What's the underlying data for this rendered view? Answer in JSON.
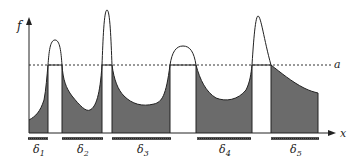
{
  "diagram": {
    "y_axis_label": "f",
    "x_axis_label": "x",
    "threshold_label": "a",
    "intervals": [
      {
        "symbol": "δ",
        "sub": "1"
      },
      {
        "symbol": "δ",
        "sub": "2"
      },
      {
        "symbol": "δ",
        "sub": "3"
      },
      {
        "symbol": "δ",
        "sub": "4"
      },
      {
        "symbol": "δ",
        "sub": "5"
      }
    ],
    "colors": {
      "fill": "#6e6e6e",
      "line": "#222222",
      "bar": "#444444"
    }
  }
}
